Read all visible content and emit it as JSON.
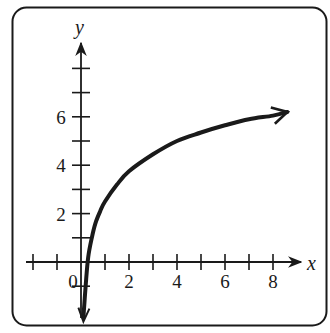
{
  "chart_data": {
    "type": "line",
    "title": "",
    "xlabel": "x",
    "ylabel": "y",
    "xlim": [
      -2,
      9
    ],
    "ylim": [
      -2,
      8
    ],
    "grid": false,
    "legend": null,
    "x_tick_labels": [
      {
        "value": 0,
        "text": "0"
      },
      {
        "value": 2,
        "text": "2"
      },
      {
        "value": 4,
        "text": "4"
      },
      {
        "value": 6,
        "text": "6"
      },
      {
        "value": 8,
        "text": "8"
      }
    ],
    "y_tick_labels": [
      {
        "value": 2,
        "text": "2"
      },
      {
        "value": 4,
        "text": "4"
      },
      {
        "value": 6,
        "text": "6"
      }
    ],
    "x_ticks": [
      -2,
      -1,
      1,
      2,
      3,
      4,
      5,
      6,
      7,
      8
    ],
    "y_ticks": [
      -1,
      1,
      2,
      3,
      4,
      5,
      6,
      7,
      8
    ],
    "series": [
      {
        "name": "curve",
        "description": "logarithmic-shaped increasing curve, vertical asymptote near x = 0 (arrow pointing down), arrow at right end",
        "x": [
          0.1,
          0.2,
          0.3,
          0.45,
          0.6,
          0.8,
          1,
          1.5,
          2,
          3,
          4,
          5,
          6,
          7,
          8,
          8.6
        ],
        "y": [
          -2.3,
          -0.9,
          0.2,
          1.0,
          1.6,
          2.1,
          2.5,
          3.2,
          3.75,
          4.45,
          5.0,
          5.35,
          5.65,
          5.9,
          6.05,
          6.2
        ]
      }
    ],
    "annotations": [
      "arrowheads on both ends of curve",
      "arrowheads on positive x and y axes"
    ]
  },
  "colors": {
    "ink": "#1a1a1a",
    "background": "#ffffff"
  }
}
